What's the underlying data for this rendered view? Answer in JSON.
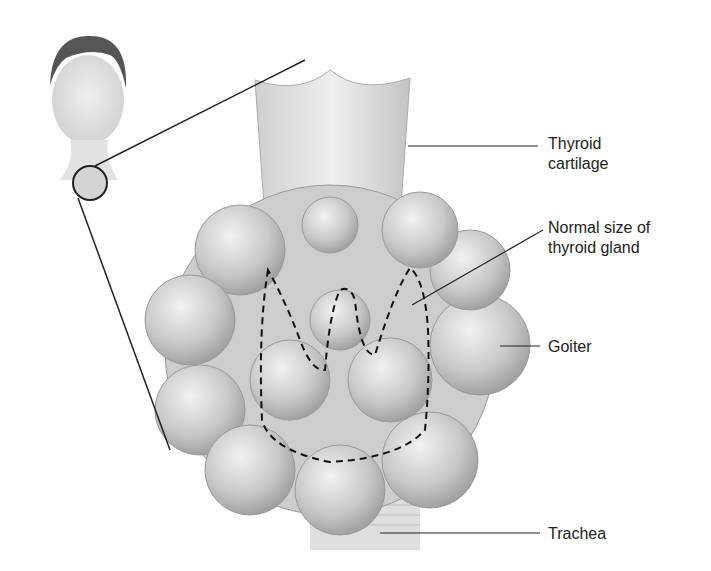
{
  "diagram": {
    "title": "Goiter",
    "labels": {
      "thyroid_cartilage": "Thyroid\ncartilage",
      "thyroid_cartilage_l1": "Thyroid",
      "thyroid_cartilage_l2": "cartilage",
      "normal_size_l1": "Normal size of",
      "normal_size_l2": "thyroid gland",
      "goiter": "Goiter",
      "trachea": "Trachea"
    },
    "inset": "head-with-neck-magnifier"
  }
}
